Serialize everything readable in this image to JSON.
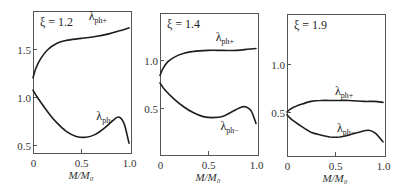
{
  "figure": {
    "width": 406,
    "height": 191
  },
  "chart_data": [
    {
      "type": "line",
      "title": "ξ = 1.2",
      "xlabel": "M/M₀",
      "ylabel": "",
      "xlim": [
        0,
        1.0
      ],
      "ylim": [
        0.42,
        1.9
      ],
      "xticks": [
        0,
        0.5,
        1.0
      ],
      "xtick_labels": [
        "0",
        "0.5",
        "1.0"
      ],
      "yticks": [
        0.5,
        1.0,
        1.5
      ],
      "ytick_labels": [
        "0.5",
        "1.0",
        "1.5"
      ],
      "grid": false,
      "frame": {
        "x0": 33,
        "y0": 11,
        "x1": 131,
        "y1": 153,
        "px_x0": 33,
        "px_x1": 129,
        "px_y_at_1": 97,
        "px_per_unit": 96
      },
      "series": [
        {
          "name": "λ_ph+",
          "label_pos": {
            "x": 0.58,
            "y": 1.8
          },
          "x": [
            0,
            0.03,
            0.08,
            0.15,
            0.25,
            0.35,
            0.5,
            0.65,
            0.8,
            0.9,
            1.0
          ],
          "y": [
            1.2,
            1.3,
            1.4,
            1.49,
            1.56,
            1.59,
            1.61,
            1.63,
            1.66,
            1.69,
            1.72
          ]
        },
        {
          "name": "λ_ph−",
          "label_pos": {
            "x": 0.66,
            "y": 0.76
          },
          "x": [
            0,
            0.05,
            0.15,
            0.25,
            0.35,
            0.45,
            0.55,
            0.65,
            0.75,
            0.85,
            0.9,
            0.95,
            1.0
          ],
          "y": [
            1.07,
            0.99,
            0.85,
            0.73,
            0.64,
            0.59,
            0.58,
            0.61,
            0.68,
            0.77,
            0.79,
            0.72,
            0.52
          ]
        }
      ]
    },
    {
      "type": "line",
      "title": "ξ = 1.4",
      "xlabel": "M/M₀",
      "ylabel": "",
      "xlim": [
        0,
        1.0
      ],
      "ylim": [
        0.0,
        1.49
      ],
      "xticks": [
        0,
        0.5,
        1.0
      ],
      "xtick_labels": [
        "0",
        "0.5",
        "1.0"
      ],
      "yticks": [
        0.5,
        1.0
      ],
      "ytick_labels": [
        "0.5",
        "1.0"
      ],
      "grid": false,
      "frame": {
        "x0": 160,
        "y0": 13,
        "x1": 258,
        "y1": 155,
        "px_x0": 160,
        "px_x1": 256,
        "px_y_at_1": 60,
        "px_per_unit": 96
      },
      "series": [
        {
          "name": "λ_ph+",
          "label_pos": {
            "x": 0.58,
            "y": 1.2
          },
          "x": [
            0,
            0.03,
            0.08,
            0.15,
            0.25,
            0.35,
            0.5,
            0.65,
            0.8,
            0.9,
            1.0
          ],
          "y": [
            0.84,
            0.91,
            0.98,
            1.03,
            1.07,
            1.09,
            1.1,
            1.1,
            1.1,
            1.11,
            1.12
          ]
        },
        {
          "name": "λ_ph−",
          "label_pos": {
            "x": 0.63,
            "y": 0.27
          },
          "x": [
            0,
            0.05,
            0.15,
            0.25,
            0.35,
            0.45,
            0.55,
            0.65,
            0.75,
            0.85,
            0.9,
            0.95,
            1.0
          ],
          "y": [
            0.76,
            0.69,
            0.59,
            0.51,
            0.45,
            0.41,
            0.4,
            0.41,
            0.46,
            0.51,
            0.51,
            0.47,
            0.34
          ]
        }
      ]
    },
    {
      "type": "line",
      "title": "ξ = 1.9",
      "xlabel": "M/M₀",
      "ylabel": "",
      "xlim": [
        0,
        1.0
      ],
      "ylim": [
        0.04,
        1.52
      ],
      "xticks": [
        0,
        0.5,
        1.0
      ],
      "xtick_labels": [
        "0",
        "0.5",
        "1.0"
      ],
      "yticks": [
        0.5,
        1.0
      ],
      "ytick_labels": [
        "0.5",
        "1.0"
      ],
      "grid": false,
      "frame": {
        "x0": 287,
        "y0": 14,
        "x1": 385,
        "y1": 156,
        "px_x0": 287,
        "px_x1": 383,
        "px_y_at_1": 64,
        "px_per_unit": 96
      },
      "series": [
        {
          "name": "λ_ph+",
          "label_pos": {
            "x": 0.5,
            "y": 0.68
          },
          "x": [
            0,
            0.05,
            0.15,
            0.25,
            0.35,
            0.5,
            0.65,
            0.8,
            0.9,
            1.0
          ],
          "y": [
            0.5,
            0.54,
            0.58,
            0.61,
            0.62,
            0.62,
            0.62,
            0.61,
            0.61,
            0.6
          ]
        },
        {
          "name": "λ_ph−",
          "label_pos": {
            "x": 0.52,
            "y": 0.29
          },
          "x": [
            0,
            0.05,
            0.15,
            0.25,
            0.35,
            0.45,
            0.55,
            0.65,
            0.75,
            0.85,
            0.92,
            1.0
          ],
          "y": [
            0.47,
            0.42,
            0.35,
            0.29,
            0.26,
            0.24,
            0.24,
            0.26,
            0.29,
            0.31,
            0.28,
            0.19
          ]
        }
      ]
    }
  ],
  "panels": [
    {
      "xi_label": "ξ = 1.2",
      "upper_label": "λ",
      "upper_sub": "ph+",
      "lower_label": "λ",
      "lower_sub": "ph−",
      "xlabel": "M/M₀"
    },
    {
      "xi_label": "ξ = 1.4",
      "upper_label": "λ",
      "upper_sub": "ph+",
      "lower_label": "λ",
      "lower_sub": "ph−",
      "xlabel": "M/M₀"
    },
    {
      "xi_label": "ξ = 1.9",
      "upper_label": "λ",
      "upper_sub": "ph+",
      "lower_label": "λ",
      "lower_sub": "ph−",
      "xlabel": "M/M₀"
    }
  ]
}
